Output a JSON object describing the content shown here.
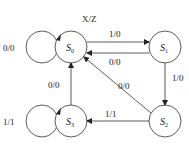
{
  "diagram": {
    "type": "state-machine",
    "legend": "X/Z",
    "states": [
      {
        "id": "S0",
        "name": "S",
        "sub": "0"
      },
      {
        "id": "S1",
        "name": "S",
        "sub": "1"
      },
      {
        "id": "S2",
        "name": "S",
        "sub": "2"
      },
      {
        "id": "S3",
        "name": "S",
        "sub": "3"
      }
    ],
    "transitions": [
      {
        "from": "S0",
        "to": "S0",
        "label": "0/0"
      },
      {
        "from": "S0",
        "to": "S1",
        "label": "1/0"
      },
      {
        "from": "S1",
        "to": "S0",
        "label": "0/0"
      },
      {
        "from": "S1",
        "to": "S2",
        "label": "1/0"
      },
      {
        "from": "S2",
        "to": "S0",
        "label": "0/0"
      },
      {
        "from": "S2",
        "to": "S3",
        "label": "1/1"
      },
      {
        "from": "S3",
        "to": "S0",
        "label": "0/0"
      },
      {
        "from": "S3",
        "to": "S3",
        "label": "1/1"
      }
    ]
  }
}
